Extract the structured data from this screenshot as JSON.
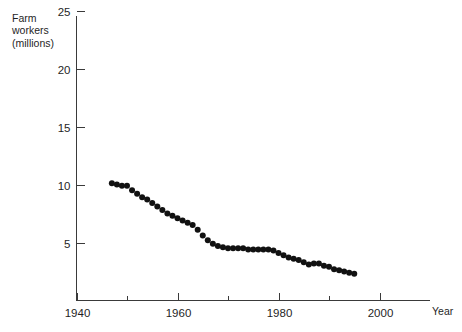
{
  "figure": {
    "faint_header_text": "",
    "background_color": "#ffffff",
    "marker_color": "#111111",
    "axis_color": "#3a3a3a"
  },
  "axes": {
    "y_title_lines": [
      "Farm",
      "workers",
      "(millions)"
    ],
    "x_title": "Year",
    "y_ticks": [
      "5",
      "10",
      "15",
      "20",
      "25"
    ],
    "x_ticks": [
      "1940",
      "1960",
      "1980",
      "2000"
    ],
    "x_minor_ticks": [
      "1950",
      "1970",
      "1990"
    ]
  },
  "chart_data": {
    "type": "scatter",
    "title": "",
    "subtitle": "",
    "xlabel": "Year",
    "ylabel": "Farm workers (millions)",
    "xlim": [
      1940,
      2003
    ],
    "ylim": [
      0,
      26
    ],
    "xticks": [
      1940,
      1960,
      1980,
      2000
    ],
    "xticklabels": [
      "1940",
      "1960",
      "1980",
      "2000"
    ],
    "x_minor_ticks": [
      1950,
      1970,
      1990
    ],
    "yticks": [
      5,
      10,
      15,
      20,
      25
    ],
    "yticklabels": [
      "5",
      "10",
      "15",
      "20",
      "25"
    ],
    "grid": false,
    "legend": false,
    "legend_position": "none",
    "marker": "filled-circle",
    "marker_size_px": 3.0,
    "series": [
      {
        "name": "Farm workers",
        "x": [
          1947,
          1948,
          1949,
          1950,
          1951,
          1952,
          1953,
          1954,
          1955,
          1956,
          1957,
          1958,
          1959,
          1960,
          1961,
          1962,
          1963,
          1964,
          1965,
          1966,
          1967,
          1968,
          1969,
          1970,
          1971,
          1972,
          1973,
          1974,
          1975,
          1976,
          1977,
          1978,
          1979,
          1980,
          1981,
          1982,
          1983,
          1984,
          1985,
          1986,
          1987,
          1988,
          1989,
          1990,
          1991,
          1992,
          1993,
          1994,
          1995
        ],
        "y": [
          10.1,
          10.0,
          9.9,
          9.9,
          9.5,
          9.2,
          8.9,
          8.7,
          8.4,
          8.1,
          7.8,
          7.5,
          7.3,
          7.1,
          6.9,
          6.7,
          6.5,
          6.1,
          5.6,
          5.2,
          4.9,
          4.7,
          4.6,
          4.5,
          4.5,
          4.5,
          4.5,
          4.4,
          4.4,
          4.4,
          4.4,
          4.4,
          4.3,
          4.1,
          3.9,
          3.7,
          3.6,
          3.5,
          3.3,
          3.1,
          3.2,
          3.2,
          3.0,
          2.9,
          2.7,
          2.6,
          2.5,
          2.4,
          2.3
        ]
      }
    ]
  }
}
